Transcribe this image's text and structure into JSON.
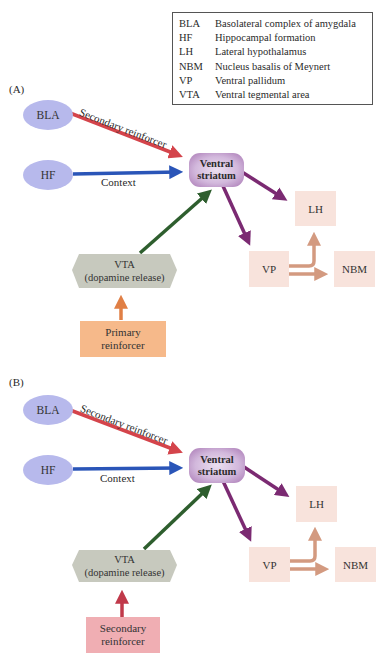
{
  "legend": {
    "items": [
      {
        "abbr": "BLA",
        "full": "Basolateral complex of amygdala"
      },
      {
        "abbr": "HF",
        "full": "Hippocampal formation"
      },
      {
        "abbr": "LH",
        "full": "Lateral hypothalamus"
      },
      {
        "abbr": "NBM",
        "full": "Nucleus basalis of Meynert"
      },
      {
        "abbr": "VP",
        "full": "Ventral pallidum"
      },
      {
        "abbr": "VTA",
        "full": "Ventral tegmental area"
      }
    ]
  },
  "colors": {
    "secondary_reinforcer_arrow": "#d4444b",
    "context_arrow": "#2a55b8",
    "dopamine_arrow": "#2e5e2e",
    "striatum_output_arrow": "#7b2a72",
    "vp_output_arrow": "#d39a80",
    "primary_reinforcer_arrow": "#e07f45",
    "secondary_input_arrow": "#c0394a"
  },
  "panels": [
    {
      "label": "(A)",
      "nodes": {
        "bla": "BLA",
        "hf": "HF",
        "vs_line1": "Ventral",
        "vs_line2": "striatum",
        "lh": "LH",
        "vp": "VP",
        "nbm": "NBM",
        "vta_line1": "VTA",
        "vta_line2": "(dopamine release)",
        "input_line1": "Primary",
        "input_line2": "reinforcer"
      },
      "edges": {
        "bla_to_vs": "Secondary reinforcer",
        "hf_to_vs": "Context"
      }
    },
    {
      "label": "(B)",
      "nodes": {
        "bla": "BLA",
        "hf": "HF",
        "vs_line1": "Ventral",
        "vs_line2": "striatum",
        "lh": "LH",
        "vp": "VP",
        "nbm": "NBM",
        "vta_line1": "VTA",
        "vta_line2": "(dopamine release)",
        "input_line1": "Secondary",
        "input_line2": "reinforcer"
      },
      "edges": {
        "bla_to_vs": "Secondary reinforcer",
        "hf_to_vs": "Context"
      }
    }
  ]
}
